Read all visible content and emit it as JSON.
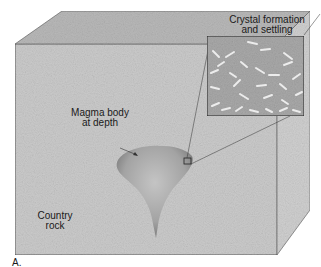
{
  "figure": {
    "panel_label": "A.",
    "labels": {
      "inset_title_line1": "Crystal formation",
      "inset_title_line2": "and settling",
      "magma_line1": "Magma body",
      "magma_line2": "at depth",
      "country_line1": "Country",
      "country_line2": "rock"
    },
    "colors": {
      "front_face": "#c9c9c9",
      "top_face": "#b5b5b5",
      "side_face": "#d2d2d2",
      "magma": "#9a9a9a",
      "inset_bg": "#a8a8a8",
      "outline": "#444444"
    }
  }
}
